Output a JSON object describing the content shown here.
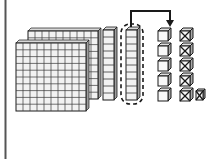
{
  "figure": {
    "title": "Base-ten blocks regrouping: one ten rod exchanged for ten unit cubes",
    "width": 206,
    "height": 159,
    "background_color": "#ffffff",
    "ink_color": "#1a1a1a",
    "face_fill": "#f2f2f2",
    "shade_fill": "#bdbdbd",
    "left_rule": {
      "label": "page-margin-rule",
      "x": 5,
      "y_top": 0,
      "y_bottom": 159,
      "color": "#555555",
      "width": 2
    }
  },
  "flats": {
    "label": "hundreds-flats",
    "count": 2,
    "rows": 10,
    "columns": 10,
    "unit_value": 100,
    "total_value": 200,
    "front": {
      "x": 16,
      "y": 43,
      "width": 70,
      "height": 68
    },
    "back_offset": {
      "dx": 12,
      "dy": -12
    },
    "caption": "2 flats = 200"
  },
  "rods": {
    "label": "tens-rods",
    "count": 2,
    "segments": 10,
    "unit_value": 10,
    "total_value": 20,
    "items": [
      {
        "name": "rod-1",
        "x": 103,
        "y": 30,
        "width": 11,
        "height": 70,
        "circled": false
      },
      {
        "name": "rod-2",
        "x": 126,
        "y": 30,
        "width": 11,
        "height": 70,
        "circled": true
      }
    ],
    "caption": "2 rods = 20"
  },
  "selection": {
    "label": "dashed-selection-ring",
    "target": "rod-2",
    "x": 121,
    "y": 24,
    "width": 22,
    "height": 80,
    "corner_radius": 9,
    "dash": "4 3",
    "stroke_width": 1.6,
    "caption": "regrouped ten"
  },
  "arrow": {
    "label": "regroup-arrow",
    "from_x": 131,
    "top_y": 11,
    "to_x": 170,
    "tip_y": 27,
    "stroke_width": 2,
    "head_size": 6,
    "caption": "exchange one ten for ten ones"
  },
  "units": {
    "label": "ones-cubes-column",
    "unit_value": 1,
    "cube_size": 10,
    "origin": {
      "x": 158,
      "y": 28
    },
    "row_step": 15,
    "col_step": 22,
    "rows": [
      {
        "index": 1,
        "cubes": [
          "plain",
          "crossed"
        ]
      },
      {
        "index": 2,
        "cubes": [
          "plain",
          "crossed"
        ]
      },
      {
        "index": 3,
        "cubes": [
          "plain",
          "crossed"
        ]
      },
      {
        "index": 4,
        "cubes": [
          "plain",
          "crossed"
        ]
      },
      {
        "index": 5,
        "cubes": [
          "plain",
          "crossed",
          "crossed"
        ]
      }
    ],
    "plain_count": 5,
    "crossed_count": 6,
    "total_count": 11,
    "caption": "11 ones: 6 crossed out"
  },
  "legend": {
    "plain_cube": "unit cube",
    "crossed_cube": "unit cube crossed out (subtracted)",
    "rod": "rod of ten",
    "flat": "flat of one hundred"
  }
}
